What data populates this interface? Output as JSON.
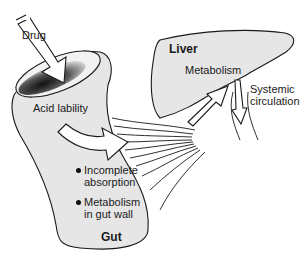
{
  "diagram": {
    "colors": {
      "organ_fill": "#e6e6e6",
      "outline": "#1a1a1a",
      "lumen_dark": "#222222",
      "arrow_fill": "#ffffff",
      "background": "#ffffff"
    },
    "labels": {
      "drug": "Drug",
      "acid_lability": "Acid lability",
      "incomplete_line1": "Incomplete",
      "incomplete_line2": "absorption",
      "gut_metab_line1": "Metabolism",
      "gut_metab_line2": "in gut wall",
      "gut": "Gut",
      "liver": "Liver",
      "metabolism": "Metabolism",
      "systemic_line1": "Systemic",
      "systemic_line2": "circulation"
    },
    "nodes": [
      {
        "id": "drug",
        "label": "Drug"
      },
      {
        "id": "gut",
        "label": "Gut"
      },
      {
        "id": "liver",
        "label": "Liver"
      },
      {
        "id": "systemic",
        "label": "Systemic circulation"
      }
    ],
    "edges": [
      {
        "from": "drug",
        "to": "gut"
      },
      {
        "from": "gut",
        "to": "liver",
        "via": "portal vessels"
      },
      {
        "from": "liver",
        "to": "systemic"
      }
    ],
    "gut_losses": [
      "Acid lability",
      "Incomplete absorption",
      "Metabolism in gut wall"
    ],
    "liver_processes": [
      "Metabolism"
    ]
  }
}
